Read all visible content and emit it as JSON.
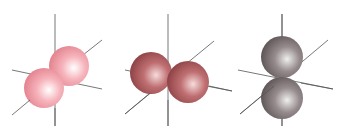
{
  "diagram": {
    "orbitals": [
      {
        "name": "px",
        "orientation": "diagonal-x",
        "color": "#f4a7b0",
        "shade": "#d9707d",
        "highlight": "#ffffff",
        "axis_color": "#555555",
        "lobes": [
          {
            "cx": 69,
            "cy": 66,
            "r": 20
          },
          {
            "cx": 44,
            "cy": 88,
            "r": 20
          }
        ]
      },
      {
        "name": "py",
        "orientation": "horizontal-y",
        "color": "#b76466",
        "shade": "#8b3f42",
        "highlight": "#f6dcdc",
        "axis_color": "#555555",
        "lobes": [
          {
            "cx": 151,
            "cy": 73,
            "r": 21
          },
          {
            "cx": 188,
            "cy": 82,
            "r": 21
          }
        ]
      },
      {
        "name": "pz",
        "orientation": "vertical-z",
        "color": "#8d8484",
        "shade": "#5a5152",
        "highlight": "#f0eeee",
        "axis_color": "#555555",
        "lobes": [
          {
            "cx": 282,
            "cy": 57,
            "r": 21
          },
          {
            "cx": 282,
            "cy": 98,
            "r": 21
          }
        ]
      }
    ]
  }
}
